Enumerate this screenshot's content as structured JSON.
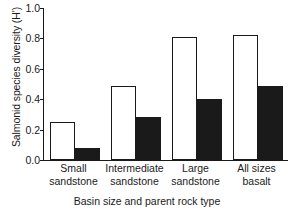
{
  "chart_data": {
    "type": "bar",
    "title": "",
    "subtitle": "",
    "xlabel": "Basin size and parent rock type",
    "ylabel": "Salmonid species diversity (H')",
    "ylabel_main": "Salmonid species diversity (",
    "ylabel_symbol": "H'",
    "ylabel_end": ")",
    "categories": [
      "Small sandstone",
      "Intermediate sandstone",
      "Large sandstone",
      "All sizes basalt"
    ],
    "category_lines": [
      [
        "Small",
        "sandstone"
      ],
      [
        "Intermediate",
        "sandstone"
      ],
      [
        "Large",
        "sandstone"
      ],
      [
        "All sizes",
        "basalt"
      ]
    ],
    "series": [
      {
        "name": "open",
        "fill": "#ffffff",
        "edge": "#1a1a1a",
        "values": [
          0.25,
          0.49,
          0.81,
          0.82
        ]
      },
      {
        "name": "filled",
        "fill": "#1a1a1a",
        "edge": "#1a1a1a",
        "values": [
          0.08,
          0.28,
          0.4,
          0.49
        ]
      }
    ],
    "ylim": [
      0.0,
      1.0
    ],
    "yticks": [
      0.0,
      0.2,
      0.4,
      0.6,
      0.8,
      1.0
    ],
    "ytick_labels": [
      "0.0",
      "0.2",
      "0.4",
      "0.6",
      "0.8",
      "1.0"
    ],
    "grid": false,
    "legend": false,
    "legend_position": "none",
    "axis_color": "#1a1a1a",
    "background": "#ffffff"
  }
}
